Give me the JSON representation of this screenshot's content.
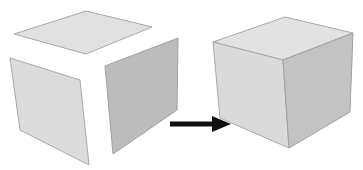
{
  "diagram": {
    "colors": {
      "background": "#ffffff",
      "top_face": "#e1e1e1",
      "left_face": "#dcdcdc",
      "right_face": "#bfbfbf",
      "edge": "#a8a8a8",
      "arrow": "#111111"
    },
    "exploded_cube": {
      "top_face": "14,34 86,11 152,27 86,54",
      "left_face": "10,58 80,80 89,165 20,130",
      "right_face": "105,66 178,38 177,110 113,154"
    },
    "arrow": {
      "shaft": {
        "x1": 170,
        "y1": 124,
        "x2": 214,
        "y2": 124
      },
      "head": "212,116 231,124 212,132"
    },
    "assembled_cube": {
      "top_face": "213,42 285,17 353,33 283,60",
      "left_face": "213,42 283,60 289,148 220,118",
      "right_face": "283,60 353,33 350,112 289,148"
    }
  }
}
